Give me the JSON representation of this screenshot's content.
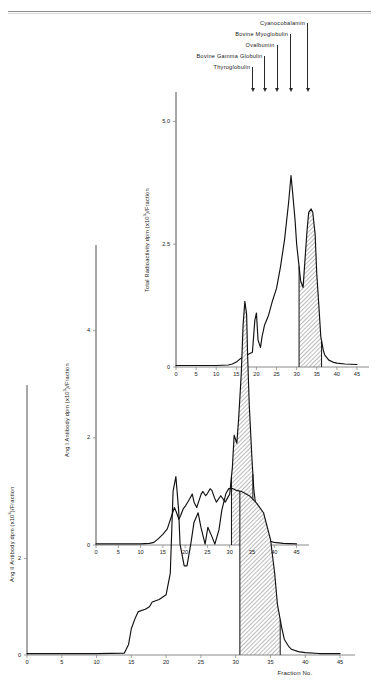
{
  "header": {
    "running_title": ""
  },
  "markers": {
    "items": [
      {
        "label": "Thyroglobulin",
        "fraction": 19.0
      },
      {
        "label": "Bovine Gamma Globulin",
        "fraction": 22.0
      },
      {
        "label": "Ovalbumin",
        "fraction": 25.0
      },
      {
        "label": "Bovine Myoglobulin",
        "fraction": 28.4
      },
      {
        "label": "Cyanocobalamin",
        "fraction": 32.6
      }
    ]
  },
  "axis": {
    "x_label": "Fraction No.",
    "x_ticks": [
      0,
      5,
      10,
      15,
      20,
      25,
      30,
      35,
      40,
      45
    ],
    "x_min": 0,
    "x_max": 46
  },
  "chart_data": [
    {
      "type": "line",
      "name": "top-panel",
      "title": "",
      "xlabel": "",
      "ylabel": "Total Radioactivity  dpm (x10³)/Fraction",
      "ylabel_pre": "Total Radioactivity  dpm (x10",
      "ylabel_sup": "3",
      "ylabel_post": ")/Fraction",
      "xlim": [
        0,
        46
      ],
      "ylim": [
        0,
        5.6
      ],
      "y_ticks": [
        0,
        2.5,
        5.0
      ],
      "y_tick_labels": [
        "0",
        "2.5",
        "5.0"
      ],
      "grid": false,
      "shaded_region": [
        30.6,
        36.2
      ],
      "x": [
        0,
        5,
        10,
        13,
        14,
        15,
        16,
        17,
        18,
        19,
        19.6,
        20,
        20.4,
        21,
        21.4,
        22,
        23,
        24,
        25,
        26,
        27,
        28,
        28.6,
        29,
        29.6,
        30,
        30.6,
        31,
        31.6,
        32,
        32.6,
        33,
        33.6,
        34,
        34.6,
        35,
        35.6,
        36,
        36.6,
        37,
        38,
        39,
        40,
        42,
        45
      ],
      "y": [
        0.03,
        0.03,
        0.03,
        0.04,
        0.06,
        0.1,
        0.17,
        0.22,
        0.26,
        0.3,
        0.95,
        1.1,
        0.55,
        0.4,
        0.62,
        0.85,
        1.05,
        1.35,
        1.6,
        2.05,
        2.6,
        3.35,
        3.9,
        3.55,
        3.0,
        2.5,
        2.05,
        1.75,
        1.62,
        2.1,
        2.8,
        3.15,
        3.22,
        3.15,
        2.7,
        1.9,
        1.15,
        0.62,
        0.35,
        0.24,
        0.14,
        0.1,
        0.08,
        0.06,
        0.05
      ]
    },
    {
      "type": "line",
      "name": "middle-panel",
      "title": "",
      "xlabel": "",
      "ylabel": "Ang I Antibody  dpm (x10³)/Fraction",
      "ylabel_pre": "Ang I Antibody  dpm (x10",
      "ylabel_sup": "3",
      "ylabel_post": ")/Fraction",
      "xlim": [
        0,
        46
      ],
      "ylim": [
        0,
        5.6
      ],
      "y_ticks": [
        0,
        2,
        4
      ],
      "y_tick_labels": [
        "0",
        "2",
        "4"
      ],
      "grid": false,
      "shaded_region": [
        30.4,
        35.2
      ],
      "x": [
        0,
        5,
        10,
        12,
        13,
        14,
        15,
        16,
        17,
        17.6,
        18,
        18.6,
        19,
        19.6,
        20,
        21,
        21.6,
        22,
        22.6,
        23,
        23.6,
        24,
        24.6,
        25,
        25.6,
        26,
        26.6,
        27,
        28,
        29,
        30,
        30.6,
        31,
        31.6,
        32,
        32.6,
        33,
        33.4,
        33.8,
        34,
        34.4,
        35,
        35.4,
        36,
        36.6,
        37,
        38,
        39,
        40,
        42,
        45
      ],
      "y": [
        0.02,
        0.02,
        0.02,
        0.03,
        0.05,
        0.12,
        0.2,
        0.3,
        0.55,
        0.7,
        0.62,
        0.48,
        0.55,
        0.68,
        0.72,
        0.86,
        0.95,
        0.8,
        0.7,
        0.8,
        0.95,
        1.0,
        0.92,
        0.96,
        1.05,
        1.02,
        0.88,
        0.8,
        0.92,
        0.8,
        0.95,
        1.45,
        2.05,
        1.9,
        2.35,
        3.2,
        4.1,
        4.55,
        4.3,
        3.6,
        2.6,
        1.6,
        1.05,
        0.62,
        0.35,
        0.22,
        0.12,
        0.07,
        0.05,
        0.03,
        0.02
      ]
    },
    {
      "type": "line",
      "name": "bottom-panel",
      "title": "",
      "xlabel": "Fraction No.",
      "ylabel": "Ang II Antibody  dpm (x10³)/Fraction",
      "ylabel_pre": "Ang II Antibody  dpm (x10",
      "ylabel_sup": "3",
      "ylabel_post": ")/Fraction",
      "xlim": [
        0,
        46
      ],
      "ylim": [
        0,
        5.6
      ],
      "y_ticks": [
        0,
        2
      ],
      "y_tick_labels": [
        "0",
        "2"
      ],
      "grid": false,
      "shaded_region": [
        30.6,
        36.4
      ],
      "x": [
        0,
        5,
        10,
        14,
        14.6,
        15,
        15.6,
        16,
        17,
        17.6,
        18,
        19,
        20,
        20.6,
        21,
        21.4,
        21.8,
        22,
        22.6,
        23,
        23.6,
        24,
        24.6,
        25,
        25.6,
        26,
        26.6,
        27,
        27.6,
        28,
        28.6,
        29,
        29.6,
        30,
        30.6,
        31,
        32,
        33,
        34,
        35,
        35.6,
        36,
        36.6,
        37,
        37.6,
        38,
        39,
        40,
        42,
        45
      ],
      "y": [
        0.03,
        0.03,
        0.03,
        0.04,
        0.22,
        0.55,
        0.78,
        0.9,
        0.95,
        1.0,
        1.1,
        1.15,
        1.25,
        1.7,
        3.4,
        3.7,
        3.0,
        2.3,
        1.85,
        1.85,
        2.35,
        2.75,
        2.95,
        2.65,
        2.3,
        2.65,
        2.45,
        2.3,
        2.6,
        3.0,
        3.35,
        3.45,
        3.45,
        3.42,
        3.4,
        3.38,
        3.3,
        3.15,
        2.95,
        2.4,
        1.7,
        1.05,
        0.58,
        0.32,
        0.18,
        0.12,
        0.07,
        0.05,
        0.03,
        0.03
      ]
    }
  ]
}
